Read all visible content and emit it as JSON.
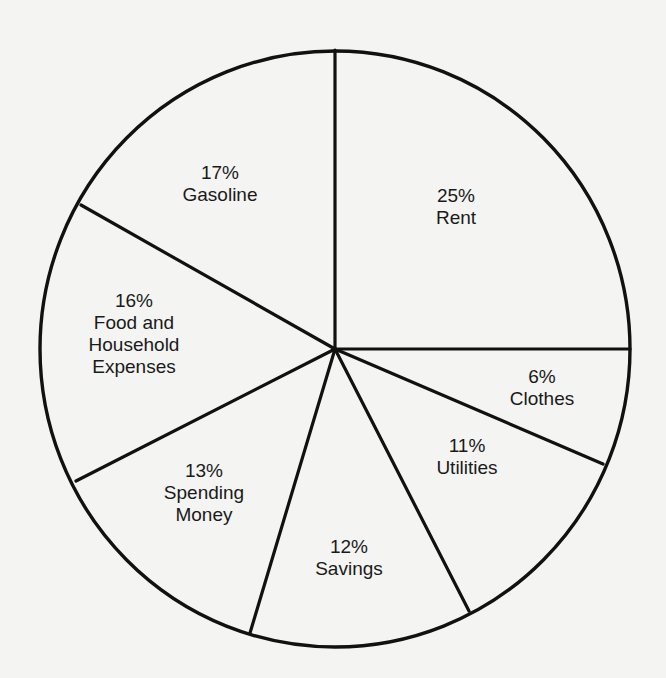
{
  "chart_data": {
    "type": "pie",
    "title": "",
    "start_angle_deg": 0,
    "direction": "clockwise from 12 o'clock",
    "slices": [
      {
        "key": "rent",
        "label": "Rent",
        "percent_label": "25%",
        "value": 25,
        "label_lines": [
          "25%",
          "Rent"
        ],
        "label_pos": [
          456,
          185
        ]
      },
      {
        "key": "clothes",
        "label": "Clothes",
        "percent_label": "6%",
        "value": 6,
        "label_lines": [
          "6%",
          "Clothes"
        ],
        "label_pos": [
          542,
          366
        ]
      },
      {
        "key": "utilities",
        "label": "Utilities",
        "percent_label": "11%",
        "value": 11,
        "label_lines": [
          "11%",
          "Utilities"
        ],
        "label_pos": [
          467,
          435
        ]
      },
      {
        "key": "savings",
        "label": "Savings",
        "percent_label": "12%",
        "value": 12,
        "label_lines": [
          "12%",
          "Savings"
        ],
        "label_pos": [
          349,
          536
        ]
      },
      {
        "key": "spending_money",
        "label": "Spending Money",
        "percent_label": "13%",
        "value": 13,
        "label_lines": [
          "13%",
          "Spending",
          "Money"
        ],
        "label_pos": [
          204,
          460
        ]
      },
      {
        "key": "food_household",
        "label": "Food and Household Expenses",
        "percent_label": "16%",
        "value": 16,
        "label_lines": [
          "16%",
          "Food and",
          "Household",
          "Expenses"
        ],
        "label_pos": [
          134,
          290
        ]
      },
      {
        "key": "gasoline",
        "label": "Gasoline",
        "percent_label": "17%",
        "value": 17,
        "label_lines": [
          "17%",
          "Gasoline"
        ],
        "label_pos": [
          220,
          162
        ]
      }
    ],
    "boundary_points": [
      [
        335,
        50
      ],
      [
        630,
        349
      ],
      [
        603,
        464
      ],
      [
        469,
        611
      ],
      [
        250,
        633
      ],
      [
        76,
        481
      ],
      [
        81,
        205
      ]
    ],
    "center": [
      335,
      349
    ],
    "radius": [
      295,
      298
    ],
    "colors": {
      "background": "#f4f4f2",
      "stroke": "#111111",
      "text": "#1a1a1a"
    }
  }
}
